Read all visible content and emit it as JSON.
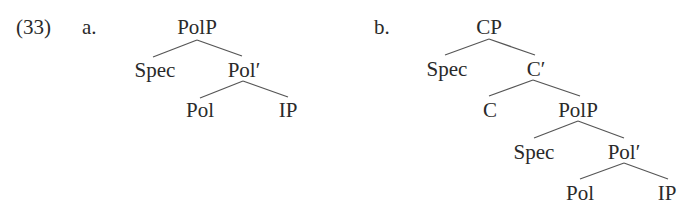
{
  "example": {
    "number": "(33)",
    "a": {
      "label": "a.",
      "nodes": {
        "root": "PolP",
        "spec": "Spec",
        "bar": "Pol′",
        "head": "Pol",
        "comp": "IP"
      }
    },
    "b": {
      "label": "b.",
      "nodes": {
        "root": "CP",
        "spec": "Spec",
        "bar": "C′",
        "head": "C",
        "comp": "PolP",
        "comp_spec": "Spec",
        "comp_bar": "Pol′",
        "comp_head": "Pol",
        "comp_comp": "IP"
      }
    }
  }
}
